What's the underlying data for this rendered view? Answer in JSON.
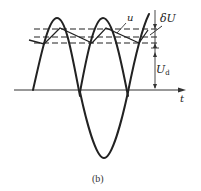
{
  "figure": {
    "caption": "(b)",
    "labels": {
      "u": "u",
      "delta_u": "δU",
      "ud_main": "U",
      "ud_sub": "d",
      "t": "t"
    },
    "colors": {
      "stroke": "#222222",
      "background": "#ffffff"
    }
  }
}
